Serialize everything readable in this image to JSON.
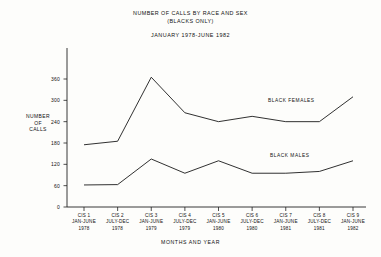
{
  "figure": {
    "title_line1": "NUMBER OF CALLS BY RACE AND SEX",
    "title_line2": "(BLACKS ONLY)",
    "date_range": "JANUARY 1978-JUNE 1982"
  },
  "axis": {
    "ylabel_line1": "NUMBER",
    "ylabel_line2": "OF",
    "ylabel_line3": "CALLS",
    "xlabel": "MONTHS AND YEAR"
  },
  "chart_data": {
    "type": "line",
    "title": "NUMBER OF CALLS BY RACE AND SEX (BLACKS ONLY)",
    "subtitle": "JANUARY 1978-JUNE 1982",
    "xlabel": "MONTHS AND YEAR",
    "ylabel": "NUMBER OF CALLS",
    "ylim": [
      0,
      360
    ],
    "yticks": [
      0,
      60,
      120,
      180,
      240,
      300,
      360
    ],
    "ytick_labels": [
      "0",
      "60",
      "120",
      "180",
      "240",
      "300",
      "360"
    ],
    "grid": false,
    "legend_position": "inline-annotation",
    "categories": [
      "CIS 1",
      "CIS 2",
      "CIS 3",
      "CIS 4",
      "CIS 5",
      "CIS 6",
      "CIS 7",
      "CIS 8",
      "CIS 9"
    ],
    "category_periods": [
      "JAN-JUNE",
      "JULY-DEC",
      "JAN-JUNE",
      "JULY-DEC",
      "JAN-JUNE",
      "JULY-DEC",
      "JAN-JUNE",
      "JULY-DEC",
      "JAN-JUNE"
    ],
    "category_years": [
      "1978",
      "1978",
      "1979",
      "1979",
      "1980",
      "1980",
      "1981",
      "1981",
      "1982"
    ],
    "series": [
      {
        "name": "BLACK FEMALES",
        "values": [
          175,
          185,
          365,
          265,
          240,
          255,
          240,
          240,
          310
        ]
      },
      {
        "name": "BLACK MALES",
        "values": [
          62,
          63,
          135,
          95,
          130,
          95,
          95,
          100,
          130
        ]
      }
    ]
  }
}
